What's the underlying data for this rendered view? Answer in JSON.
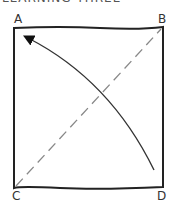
{
  "heading": "LEARNING THREE",
  "diagram": {
    "corners": {
      "top_left": "A",
      "top_right": "B",
      "bottom_left": "C",
      "bottom_right": "D"
    },
    "elements": [
      {
        "type": "square",
        "from": "A",
        "to": "D",
        "style": "solid"
      },
      {
        "type": "diagonal",
        "from": "C",
        "to": "B",
        "style": "dashed"
      },
      {
        "type": "curved-arrow",
        "from": "D",
        "to": "A",
        "style": "solid"
      }
    ],
    "colors": {
      "stroke": "#222222",
      "dashed": "#888888"
    }
  }
}
